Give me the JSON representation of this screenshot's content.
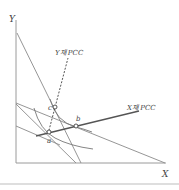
{
  "diagram": {
    "axes": {
      "y_label": "Y",
      "x_label": "X"
    },
    "curves": {
      "y_pcc_label": "Y재 PCC",
      "x_pcc_label": "X재 PCC"
    },
    "points": {
      "a": "a",
      "b": "b",
      "c": "c"
    },
    "colors": {
      "line": "#8a8a8a",
      "pcc": "#555555",
      "axis": "#9a9a9a",
      "separator": "#bdbdbd"
    }
  }
}
